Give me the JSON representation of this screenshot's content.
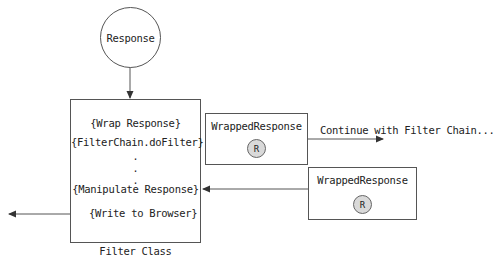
{
  "diagram": {
    "response_node": {
      "label": "Response"
    },
    "filter_class": {
      "caption": "Filter Class",
      "steps": [
        "{Wrap Response}",
        "{FilterChain.doFilter}",
        ".",
        ".",
        ".",
        "{Manipulate Response}",
        "{Write to Browser}"
      ]
    },
    "wrapped_response_out": {
      "title": "WrappedResponse",
      "badge": "R"
    },
    "wrapped_response_in": {
      "title": "WrappedResponse",
      "badge": "R"
    },
    "continue_label": "Continue with Filter Chain...",
    "colors": {
      "line": "#555555",
      "badge_fill": "#d9d9d9",
      "text": "#222222"
    }
  }
}
